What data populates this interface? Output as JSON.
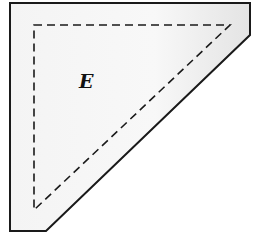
{
  "diagram": {
    "label": "E",
    "outer_shape": {
      "points": "10,3 250,3 250,35 46,231 10,231",
      "fill_start": "#f2f2f2",
      "fill_end": "#e6e6e6",
      "stroke": "#1a1a1a"
    },
    "inner_shape": {
      "points": "34,25 230,25 34,210",
      "stroke": "#1a1a1a",
      "style": "dashed"
    }
  }
}
